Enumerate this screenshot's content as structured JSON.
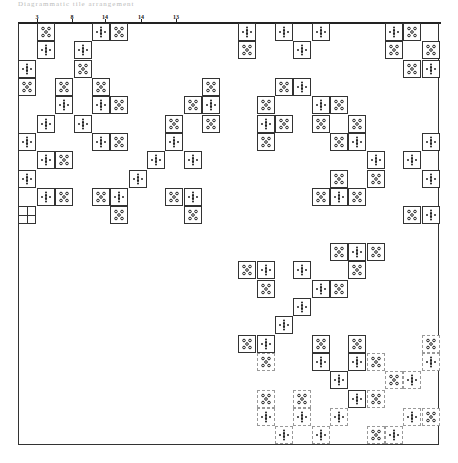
{
  "figure": {
    "caption": "Diagrammatic tile arrangement",
    "column_labels": [
      {
        "text": "3",
        "x": 37
      },
      {
        "text": "8",
        "x": 72
      },
      {
        "text": "14",
        "x": 105
      },
      {
        "text": "14",
        "x": 141
      },
      {
        "text": "13",
        "x": 176
      }
    ],
    "glyph_types": {
      "R": "ring-of-five-circles",
      "C": "cross-of-dots"
    },
    "tiles": [
      {
        "x": 37,
        "y": 23,
        "t": "R"
      },
      {
        "x": 92,
        "y": 23,
        "t": "C"
      },
      {
        "x": 110,
        "y": 23,
        "t": "R"
      },
      {
        "x": 37,
        "y": 41,
        "t": "C"
      },
      {
        "x": 74,
        "y": 41,
        "t": "C"
      },
      {
        "x": 18,
        "y": 60,
        "t": "C"
      },
      {
        "x": 74,
        "y": 60,
        "t": "R"
      },
      {
        "x": 18,
        "y": 78,
        "t": "R"
      },
      {
        "x": 55,
        "y": 78,
        "t": "R"
      },
      {
        "x": 92,
        "y": 78,
        "t": "R"
      },
      {
        "x": 55,
        "y": 96,
        "t": "C"
      },
      {
        "x": 92,
        "y": 96,
        "t": "C"
      },
      {
        "x": 110,
        "y": 96,
        "t": "R"
      },
      {
        "x": 37,
        "y": 115,
        "t": "C"
      },
      {
        "x": 74,
        "y": 115,
        "t": "C"
      },
      {
        "x": 18,
        "y": 133,
        "t": "C"
      },
      {
        "x": 92,
        "y": 133,
        "t": "C"
      },
      {
        "x": 110,
        "y": 133,
        "t": "R"
      },
      {
        "x": 37,
        "y": 151,
        "t": "C"
      },
      {
        "x": 55,
        "y": 151,
        "t": "R"
      },
      {
        "x": 18,
        "y": 170,
        "t": "C"
      },
      {
        "x": 37,
        "y": 188,
        "t": "C"
      },
      {
        "x": 55,
        "y": 188,
        "t": "R"
      },
      {
        "x": 92,
        "y": 188,
        "t": "R"
      },
      {
        "x": 110,
        "y": 188,
        "t": "C"
      },
      {
        "x": 110,
        "y": 206,
        "t": "R"
      },
      {
        "x": 202,
        "y": 78,
        "t": "R"
      },
      {
        "x": 184,
        "y": 96,
        "t": "R"
      },
      {
        "x": 202,
        "y": 96,
        "t": "C"
      },
      {
        "x": 165,
        "y": 115,
        "t": "R"
      },
      {
        "x": 202,
        "y": 115,
        "t": "R"
      },
      {
        "x": 165,
        "y": 133,
        "t": "C"
      },
      {
        "x": 147,
        "y": 151,
        "t": "C"
      },
      {
        "x": 184,
        "y": 151,
        "t": "C"
      },
      {
        "x": 129,
        "y": 170,
        "t": "C"
      },
      {
        "x": 165,
        "y": 188,
        "t": "R"
      },
      {
        "x": 184,
        "y": 188,
        "t": "C"
      },
      {
        "x": 184,
        "y": 206,
        "t": "R"
      },
      {
        "x": 238,
        "y": 23,
        "t": "C"
      },
      {
        "x": 275,
        "y": 23,
        "t": "C"
      },
      {
        "x": 312,
        "y": 23,
        "t": "C"
      },
      {
        "x": 238,
        "y": 41,
        "t": "R"
      },
      {
        "x": 293,
        "y": 41,
        "t": "C"
      },
      {
        "x": 275,
        "y": 78,
        "t": "R"
      },
      {
        "x": 293,
        "y": 78,
        "t": "C"
      },
      {
        "x": 257,
        "y": 96,
        "t": "R"
      },
      {
        "x": 312,
        "y": 96,
        "t": "C"
      },
      {
        "x": 330,
        "y": 96,
        "t": "R"
      },
      {
        "x": 257,
        "y": 115,
        "t": "C"
      },
      {
        "x": 275,
        "y": 115,
        "t": "R"
      },
      {
        "x": 312,
        "y": 115,
        "t": "R"
      },
      {
        "x": 348,
        "y": 115,
        "t": "R"
      },
      {
        "x": 257,
        "y": 133,
        "t": "R"
      },
      {
        "x": 330,
        "y": 133,
        "t": "R"
      },
      {
        "x": 348,
        "y": 133,
        "t": "C"
      },
      {
        "x": 367,
        "y": 151,
        "t": "C"
      },
      {
        "x": 330,
        "y": 170,
        "t": "R"
      },
      {
        "x": 367,
        "y": 170,
        "t": "R"
      },
      {
        "x": 312,
        "y": 188,
        "t": "R"
      },
      {
        "x": 330,
        "y": 188,
        "t": "C"
      },
      {
        "x": 348,
        "y": 188,
        "t": "R"
      },
      {
        "x": 385,
        "y": 23,
        "t": "C"
      },
      {
        "x": 403,
        "y": 23,
        "t": "R"
      },
      {
        "x": 385,
        "y": 41,
        "t": "R"
      },
      {
        "x": 422,
        "y": 41,
        "t": "R"
      },
      {
        "x": 403,
        "y": 60,
        "t": "R"
      },
      {
        "x": 422,
        "y": 60,
        "t": "C"
      },
      {
        "x": 422,
        "y": 133,
        "t": "C"
      },
      {
        "x": 403,
        "y": 151,
        "t": "C"
      },
      {
        "x": 422,
        "y": 170,
        "t": "C"
      },
      {
        "x": 403,
        "y": 206,
        "t": "R"
      },
      {
        "x": 422,
        "y": 206,
        "t": "C"
      },
      {
        "x": 330,
        "y": 243,
        "t": "R"
      },
      {
        "x": 348,
        "y": 243,
        "t": "C"
      },
      {
        "x": 367,
        "y": 243,
        "t": "R"
      },
      {
        "x": 238,
        "y": 261,
        "t": "R"
      },
      {
        "x": 257,
        "y": 261,
        "t": "C"
      },
      {
        "x": 293,
        "y": 261,
        "t": "C"
      },
      {
        "x": 348,
        "y": 261,
        "t": "R"
      },
      {
        "x": 257,
        "y": 280,
        "t": "R"
      },
      {
        "x": 312,
        "y": 280,
        "t": "C"
      },
      {
        "x": 330,
        "y": 280,
        "t": "R"
      },
      {
        "x": 293,
        "y": 298,
        "t": "C"
      },
      {
        "x": 275,
        "y": 316,
        "t": "C"
      },
      {
        "x": 238,
        "y": 335,
        "t": "R"
      },
      {
        "x": 257,
        "y": 335,
        "t": "C"
      },
      {
        "x": 312,
        "y": 335,
        "t": "R"
      },
      {
        "x": 348,
        "y": 335,
        "t": "R"
      },
      {
        "x": 422,
        "y": 335,
        "t": "R",
        "faint": true
      },
      {
        "x": 257,
        "y": 353,
        "t": "R",
        "faint": true
      },
      {
        "x": 312,
        "y": 353,
        "t": "C"
      },
      {
        "x": 348,
        "y": 353,
        "t": "C"
      },
      {
        "x": 367,
        "y": 353,
        "t": "R",
        "faint": true
      },
      {
        "x": 422,
        "y": 353,
        "t": "C",
        "faint": true
      },
      {
        "x": 330,
        "y": 371,
        "t": "C"
      },
      {
        "x": 385,
        "y": 371,
        "t": "R",
        "faint": true
      },
      {
        "x": 403,
        "y": 371,
        "t": "C",
        "faint": true
      },
      {
        "x": 257,
        "y": 390,
        "t": "R",
        "faint": true
      },
      {
        "x": 293,
        "y": 390,
        "t": "R",
        "faint": true
      },
      {
        "x": 348,
        "y": 390,
        "t": "C"
      },
      {
        "x": 367,
        "y": 390,
        "t": "R",
        "faint": true
      },
      {
        "x": 257,
        "y": 408,
        "t": "C",
        "faint": true
      },
      {
        "x": 293,
        "y": 408,
        "t": "C",
        "faint": true
      },
      {
        "x": 330,
        "y": 408,
        "t": "C",
        "faint": true
      },
      {
        "x": 403,
        "y": 408,
        "t": "C",
        "faint": true
      },
      {
        "x": 422,
        "y": 408,
        "t": "R",
        "faint": true
      },
      {
        "x": 275,
        "y": 426,
        "t": "C",
        "faint": true
      },
      {
        "x": 312,
        "y": 426,
        "t": "C",
        "faint": true
      },
      {
        "x": 367,
        "y": 426,
        "t": "R",
        "faint": true
      },
      {
        "x": 385,
        "y": 426,
        "t": "C",
        "faint": true
      }
    ]
  }
}
